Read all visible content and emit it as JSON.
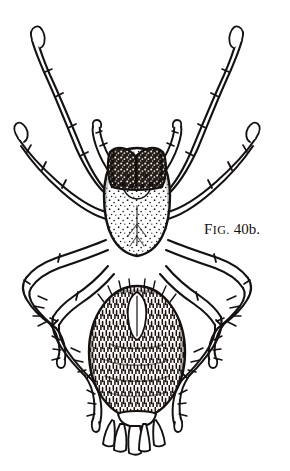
{
  "figure": {
    "caption_full": "FIG. 40b.",
    "caption_lead": "F",
    "caption_smallcaps": "IG.",
    "caption_number": "40b.",
    "ink_color": "#141110",
    "background_color": "#ffffff",
    "parts": {
      "cephalothorax": "cephalothorax",
      "head_region": "dark-head-patch",
      "eyes": "eye-group",
      "abdomen": "abdomen",
      "spinnerets": "spinnerets",
      "pedipalps": "pedipalps",
      "legs": "eight-legs"
    }
  }
}
